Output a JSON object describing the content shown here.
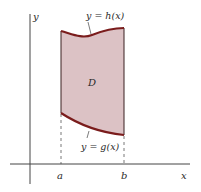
{
  "diagram": {
    "axes": {
      "x_label": "x",
      "y_label": "y"
    },
    "region": {
      "label": "D",
      "fill_color": "#dcc2c5",
      "boundary_color": "#7a1c1c"
    },
    "curves": {
      "upper": {
        "label": "y = h(x)"
      },
      "lower": {
        "label": "y = g(x)"
      }
    },
    "bounds": {
      "left": "a",
      "right": "b"
    }
  }
}
